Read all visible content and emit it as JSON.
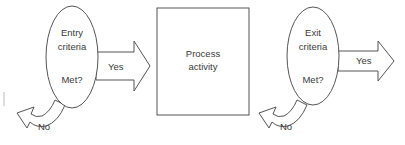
{
  "diagram": {
    "type": "flow",
    "entry": {
      "line1": "Entry",
      "line2": "criteria",
      "line3": "Met?",
      "yes_label": "Yes",
      "no_label": "No"
    },
    "process": {
      "line1": "Process",
      "line2": "activity"
    },
    "exit": {
      "line1": "Exit",
      "line2": "criteria",
      "line3": "Met?",
      "yes_label": "Yes",
      "no_label": "No"
    },
    "colors": {
      "stroke": "#555555",
      "text": "#3a3a3a",
      "background": "#ffffff"
    }
  }
}
